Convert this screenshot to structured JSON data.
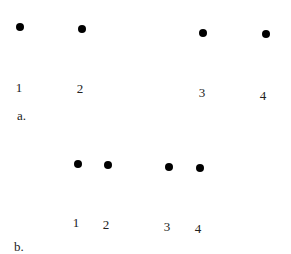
{
  "panels": [
    {
      "caption": "a.",
      "caption_pos": [
        17,
        115
      ],
      "points": [
        {
          "label": "1",
          "dot": [
            20,
            27
          ],
          "label_pos": [
            19,
            87
          ]
        },
        {
          "label": "2",
          "dot": [
            82,
            29
          ],
          "label_pos": [
            80,
            88
          ]
        },
        {
          "label": "3",
          "dot": [
            203,
            33
          ],
          "label_pos": [
            202,
            92
          ]
        },
        {
          "label": "4",
          "dot": [
            266,
            34
          ],
          "label_pos": [
            263,
            95
          ]
        }
      ]
    },
    {
      "caption": "b.",
      "caption_pos": [
        14,
        246
      ],
      "points": [
        {
          "label": "1",
          "dot": [
            78,
            164
          ],
          "label_pos": [
            76,
            222
          ]
        },
        {
          "label": "2",
          "dot": [
            108,
            165
          ],
          "label_pos": [
            106,
            224
          ]
        },
        {
          "label": "3",
          "dot": [
            169,
            167
          ],
          "label_pos": [
            167,
            226
          ]
        },
        {
          "label": "4",
          "dot": [
            200,
            168
          ],
          "label_pos": [
            198,
            228
          ]
        }
      ]
    }
  ]
}
